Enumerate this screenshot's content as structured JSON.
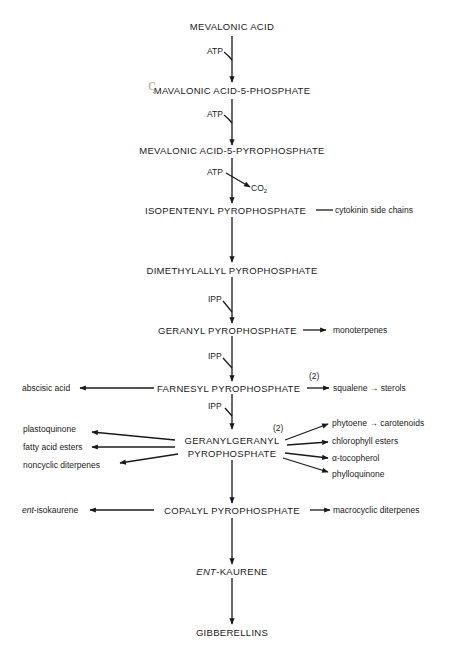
{
  "diagram": {
    "type": "metabolic-pathway",
    "main_chain": [
      {
        "label": "MEVALONIC ACID"
      },
      {
        "label": "MAVALONIC ACID-5-PHOSPHATE"
      },
      {
        "label": "MEVALONIC ACID-5-PYROPHOSPHATE"
      },
      {
        "label": "ISOPENTENYL PYROPHOSPHATE"
      },
      {
        "label": "DIMETHYLALLYL PYROPHOSPHATE"
      },
      {
        "label": "GERANYL PYROPHOSPHATE"
      },
      {
        "label": "FARNESYL PYROPHOSPHATE"
      },
      {
        "label_line1": "GERANYLGERANYL",
        "label_line2": "PYROPHOSPHATE"
      },
      {
        "label": "COPALYL PYROPHOSPHATE"
      },
      {
        "label_prefix": "ENT",
        "label_suffix": "-KAURENE"
      },
      {
        "label": "GIBBERELLINS"
      }
    ],
    "cofactors": {
      "step1": "ATP",
      "step2": "ATP",
      "step3": "ATP",
      "step3_product": "CO",
      "step3_product_sub": "2",
      "step5": "IPP",
      "step6": "IPP",
      "step7": "IPP"
    },
    "branches": {
      "ipp_right": "cytokinin side chains",
      "gpp_right": "monoterpenes",
      "fpp_left": "abscisic acid",
      "fpp_right_note": "(2)",
      "fpp_right": "squalene → sterols",
      "ggpp_left": [
        "plastoquinone",
        "fatty acid esters",
        "noncyclic diterpenes"
      ],
      "ggpp_right_note": "(2)",
      "ggpp_right": [
        "phytoene → carotenoids",
        "chlorophyll esters",
        "α-tocopherol",
        "phylloquinone"
      ],
      "cpp_left_prefix": "ent",
      "cpp_left_suffix": "-isokaurene",
      "cpp_right": "macrocyclic diterpenes"
    },
    "annotations": {
      "handwritten_mark": "ς"
    },
    "colors": {
      "ink": "#1a1a1a",
      "background": "#ffffff",
      "pencil_mark": "#b8b39a"
    }
  }
}
